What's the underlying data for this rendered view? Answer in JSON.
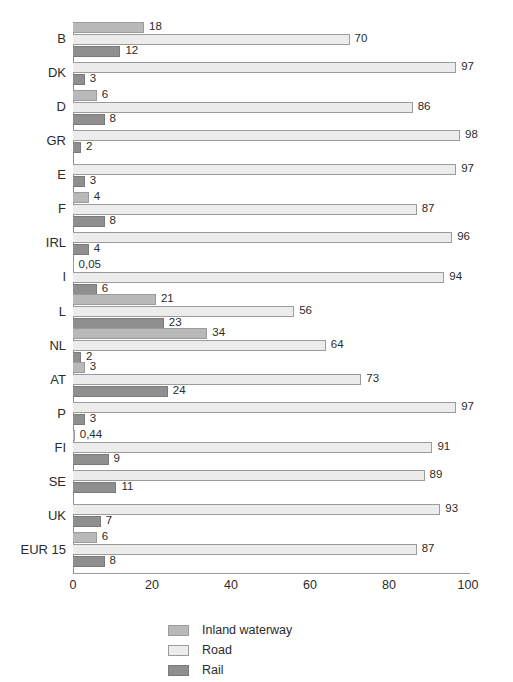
{
  "chart_data": {
    "type": "bar",
    "orientation": "horizontal",
    "title": "",
    "subtitle": "",
    "xlabel": "",
    "ylabel": "",
    "xlim": [
      0,
      100
    ],
    "xticks": [
      0,
      20,
      40,
      60,
      80,
      100
    ],
    "xtick_labels": [
      "0",
      "20",
      "40",
      "60",
      "80",
      "100"
    ],
    "grid": false,
    "legend_position": "bottom",
    "categories": [
      "B",
      "DK",
      "D",
      "GR",
      "E",
      "F",
      "IRL",
      "I",
      "L",
      "NL",
      "AT",
      "P",
      "FI",
      "SE",
      "UK",
      "EUR 15"
    ],
    "series": [
      {
        "name": "Inland waterway",
        "color": "#b9b9b9",
        "values": [
          18,
          null,
          6,
          null,
          null,
          4,
          null,
          0.05,
          21,
          34,
          3,
          null,
          0.44,
          null,
          null,
          6
        ],
        "labels": [
          "18",
          "",
          "6",
          "",
          "",
          "4",
          "",
          "0,05",
          "21",
          "34",
          "3",
          "",
          "0,44",
          "",
          "",
          "6"
        ]
      },
      {
        "name": "Road",
        "color": "#ececec",
        "values": [
          70,
          97,
          86,
          98,
          97,
          87,
          96,
          94,
          56,
          64,
          73,
          97,
          91,
          89,
          93,
          87
        ],
        "labels": [
          "70",
          "97",
          "86",
          "98",
          "97",
          "87",
          "96",
          "94",
          "56",
          "64",
          "73",
          "97",
          "91",
          "89",
          "93",
          "87"
        ]
      },
      {
        "name": "Rail",
        "color": "#8f8f8f",
        "values": [
          12,
          3,
          8,
          2,
          3,
          8,
          4,
          6,
          23,
          2,
          24,
          3,
          9,
          11,
          7,
          8
        ],
        "labels": [
          "12",
          "3",
          "8",
          "2",
          "3",
          "8",
          "4",
          "6",
          "23",
          "2",
          "24",
          "3",
          "9",
          "11",
          "7",
          "8"
        ]
      }
    ]
  },
  "legend": {
    "items": [
      {
        "label": "Inland waterway",
        "key": "inland"
      },
      {
        "label": "Road",
        "key": "road"
      },
      {
        "label": "Rail",
        "key": "rail"
      }
    ]
  }
}
